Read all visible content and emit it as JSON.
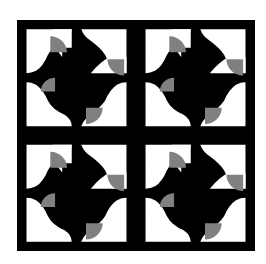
{
  "pattern": {
    "description": "Quilt-style tile pattern, 2x2 repeat of pinwheel motif with gray quarter-circle wedges",
    "grid": {
      "cols": 2,
      "rows": 2
    },
    "frame": {
      "x": 17,
      "y": 20,
      "width": 238,
      "height": 231
    },
    "colors": {
      "background": "#ffffff",
      "primary": "#000000",
      "accent": "#808080"
    }
  }
}
